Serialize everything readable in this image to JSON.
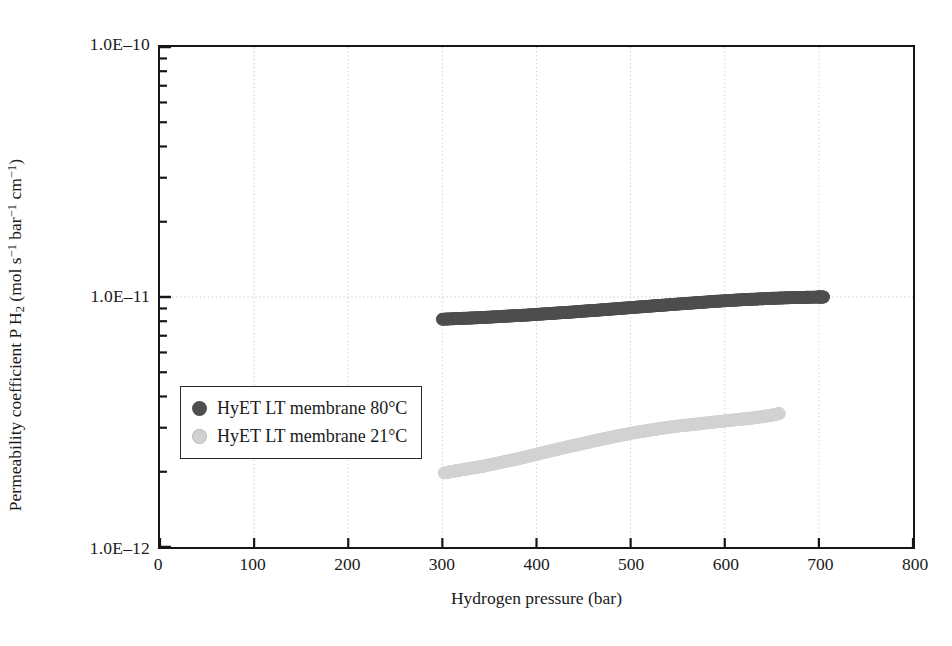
{
  "chart_data": {
    "type": "scatter",
    "title": "",
    "xlabel": "Hydrogen pressure (bar)",
    "ylabel_parts": {
      "prefix": "Permeability coefficient P H",
      "sub": "2",
      "units_open": " (mol s",
      "units_exp1": "−1",
      "units_mid": " bar",
      "units_exp2": "−1",
      "units_mid2": " cm",
      "units_exp3": "−1",
      "units_close": ")"
    },
    "ylabel": "Permeability coefficient P H2 (mol s-1 bar-1 cm-1)",
    "xlim": [
      0,
      800
    ],
    "ylim": [
      1e-12,
      1e-10
    ],
    "yscale": "log",
    "xticks": [
      0,
      100,
      200,
      300,
      400,
      500,
      600,
      700,
      800
    ],
    "xtick_labels": [
      "0",
      "100",
      "200",
      "300",
      "400",
      "500",
      "600",
      "700",
      "800"
    ],
    "yticks": [
      1e-12,
      1e-11,
      1e-10
    ],
    "ytick_labels": [
      "1.0E–12",
      "1.0E–11",
      "1.0E–10"
    ],
    "grid": true,
    "grid_style": "dotted",
    "grid_color": "#cfcfcf",
    "legend_position": "center-left",
    "series": [
      {
        "name": "HyET LT membrane 80°C",
        "color": "#4e4e4e",
        "marker": "circle",
        "marker_size": 13,
        "x": [
          300,
          310,
          320,
          330,
          340,
          350,
          360,
          370,
          380,
          390,
          400,
          410,
          420,
          430,
          440,
          450,
          460,
          470,
          480,
          490,
          500,
          510,
          520,
          530,
          540,
          550,
          560,
          570,
          580,
          590,
          600,
          610,
          620,
          630,
          640,
          650,
          660,
          670,
          680,
          690,
          700,
          705
        ],
        "y": [
          8.15e-12,
          8.18e-12,
          8.21e-12,
          8.24e-12,
          8.27e-12,
          8.31e-12,
          8.35e-12,
          8.39e-12,
          8.43e-12,
          8.47e-12,
          8.52e-12,
          8.57e-12,
          8.62e-12,
          8.67e-12,
          8.72e-12,
          8.78e-12,
          8.83e-12,
          8.89e-12,
          8.95e-12,
          9.01e-12,
          9.07e-12,
          9.13e-12,
          9.19e-12,
          9.25e-12,
          9.31e-12,
          9.37e-12,
          9.43e-12,
          9.49e-12,
          9.55e-12,
          9.61e-12,
          9.66e-12,
          9.71e-12,
          9.76e-12,
          9.8e-12,
          9.84e-12,
          9.88e-12,
          9.91e-12,
          9.94e-12,
          9.96e-12,
          9.98e-12,
          1e-11,
          1e-11
        ]
      },
      {
        "name": "HyET LT membrane 21°C",
        "color": "#d2d2d2",
        "marker": "circle",
        "marker_size": 13,
        "x": [
          302,
          312,
          322,
          332,
          342,
          352,
          362,
          372,
          382,
          392,
          402,
          412,
          422,
          432,
          442,
          452,
          462,
          472,
          482,
          492,
          502,
          512,
          522,
          532,
          542,
          552,
          562,
          572,
          582,
          592,
          602,
          612,
          622,
          632,
          642,
          652,
          658
        ],
        "y": [
          1.98e-12,
          2.01e-12,
          2.04e-12,
          2.07e-12,
          2.1e-12,
          2.14e-12,
          2.18e-12,
          2.22e-12,
          2.26e-12,
          2.31e-12,
          2.36e-12,
          2.41e-12,
          2.46e-12,
          2.51e-12,
          2.56e-12,
          2.61e-12,
          2.66e-12,
          2.71e-12,
          2.76e-12,
          2.81e-12,
          2.86e-12,
          2.9e-12,
          2.94e-12,
          2.98e-12,
          3.02e-12,
          3.05e-12,
          3.08e-12,
          3.11e-12,
          3.14e-12,
          3.17e-12,
          3.2e-12,
          3.23e-12,
          3.26e-12,
          3.29e-12,
          3.33e-12,
          3.38e-12,
          3.42e-12
        ]
      }
    ]
  },
  "legend": {
    "items": [
      {
        "label": "HyET LT membrane 80°C",
        "color": "#4e4e4e"
      },
      {
        "label": "HyET LT membrane 21°C",
        "color": "#d2d2d2"
      }
    ]
  }
}
